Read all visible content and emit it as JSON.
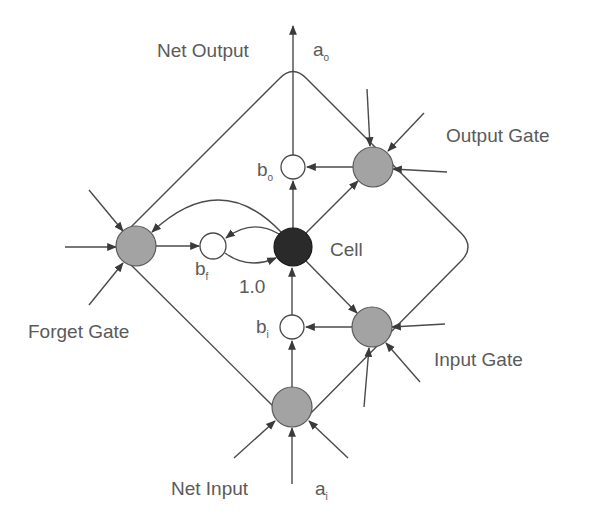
{
  "diagram": {
    "type": "LSTM memory block",
    "colors": {
      "gate_fill": "#a3a3a3",
      "cell_fill": "#2a2a2a",
      "multiplier_fill": "#ffffff",
      "line": "#4a4a4a",
      "text": "#5a5a5a"
    },
    "labels": {
      "net_output": "Net Output",
      "output_activation": "a",
      "output_activation_sub": "o",
      "output_gate": "Output Gate",
      "cell": "Cell",
      "forget_gate": "Forget Gate",
      "input_gate": "Input Gate",
      "net_input": "Net Input",
      "input_activation": "a",
      "input_activation_sub": "i",
      "self_loop_weight": "1.0",
      "b_o": "b",
      "b_o_sub": "o",
      "b_f": "b",
      "b_f_sub": "f",
      "b_i": "b",
      "b_i_sub": "i"
    },
    "nodes": [
      {
        "id": "output_gate",
        "kind": "gate"
      },
      {
        "id": "forget_gate",
        "kind": "gate"
      },
      {
        "id": "input_gate",
        "kind": "gate"
      },
      {
        "id": "net_input",
        "kind": "gate"
      },
      {
        "id": "cell",
        "kind": "cell"
      },
      {
        "id": "b_o",
        "kind": "multiplier"
      },
      {
        "id": "b_f",
        "kind": "multiplier"
      },
      {
        "id": "b_i",
        "kind": "multiplier"
      }
    ]
  }
}
